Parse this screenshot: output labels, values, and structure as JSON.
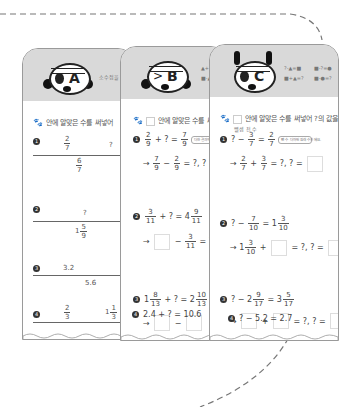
{
  "cards": {
    "a": {
      "letter": "A",
      "header_note": "소수점을 소수에서 ?",
      "instruction": "안에 알맞은 수를 써넣어",
      "problems": [
        {
          "no": "1",
          "top_left": "2/7",
          "top_right": "?",
          "bottom": "6/7"
        },
        {
          "no": "2",
          "top": "?",
          "bottom": "1 5/9"
        },
        {
          "no": "3",
          "top_left": "3.2",
          "top_right": "?",
          "bottom": "5.6"
        },
        {
          "no": "4",
          "top_left": "2/3",
          "top_right": "1 1/3"
        }
      ]
    },
    "b": {
      "letter": "B",
      "header_rules": [
        "▲+?=■",
        "■-▲=?"
      ],
      "instruction": "안에 알맞은 수를 써",
      "problems": [
        {
          "no": "1",
          "equation": "2/9 + ? = 7/9",
          "hint_label": "더한 결과",
          "bubble": "더한 결과에서 빼면 남는 값",
          "answer": "→ 7/9 − 2/9 = ?, ? ="
        },
        {
          "no": "2",
          "equation": "3/11 + ? = 4 9/11",
          "answer": "→ □ − 3/11 = ?,"
        },
        {
          "no": "3",
          "equation": "1 8/13 + ? = 2 10/13",
          "answer": "→ □ − □"
        },
        {
          "no": "4",
          "equation": "2.4 + ? = 10.6"
        }
      ]
    },
    "c": {
      "letter": "C",
      "header_rules": [
        "?-▲=■",
        "■+▲=?",
        "■-?=●",
        "■-●=?"
      ],
      "instruction": "안에 알맞은 수를 써넣어 ?의 값을",
      "problems": [
        {
          "no": "1",
          "equation": "? − 3/7 = 2/7",
          "hint_label": "뺄셈 전 수",
          "bubble": "뺀 수 더하면 원래 수가 돼요.",
          "answer": "→ 2/7 + 3/7 = ?, ? ="
        },
        {
          "no": "2",
          "equation": "? − 7/10 = 1 3/10",
          "answer": "→ 1 3/10 + □ = ?, ? ="
        },
        {
          "no": "3",
          "equation": "? − 2 9/17 = 3 5/17",
          "answer": "→ □ + □ = ?, ? ="
        },
        {
          "no": "4",
          "equation": "? − 5.2 = 2.7"
        }
      ]
    }
  },
  "colors": {
    "header_gray": "#d9d9d9",
    "border": "#9a9a9a",
    "dash": "#777777"
  }
}
